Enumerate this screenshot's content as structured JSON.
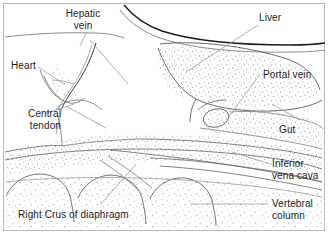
{
  "figure": {
    "background_color": "#ffffff",
    "frame_color": "#b9b9b9",
    "ink_color": "#444444",
    "dark_ink_color": "#1a1a1a",
    "leader_color": "#9a9a9a",
    "label_color": "#1d1d1d",
    "width": 330,
    "height": 236
  },
  "labels": [
    {
      "id": "hepatic-vein",
      "text": "Hepatic",
      "line2": "vein",
      "align": "center",
      "x": 82,
      "y": 8
    },
    {
      "id": "liver",
      "text": "Liver",
      "line2": "",
      "align": "left",
      "x": 259,
      "y": 12
    },
    {
      "id": "heart",
      "text": "Heart",
      "line2": "",
      "align": "left",
      "x": 11,
      "y": 60
    },
    {
      "id": "portal-vein",
      "text": "Portal vein",
      "line2": "",
      "align": "left",
      "x": 263,
      "y": 69
    },
    {
      "id": "central-tendon",
      "text": "Central",
      "line2": "tendon",
      "align": "right",
      "x": 5,
      "y": 108
    },
    {
      "id": "gut",
      "text": "Gut",
      "line2": "",
      "align": "left",
      "x": 279,
      "y": 124
    },
    {
      "id": "inferior-vena-cava",
      "text": "Inferior",
      "line2": "vena cava",
      "align": "left",
      "x": 272,
      "y": 158
    },
    {
      "id": "vertebral-column",
      "text": "Vertebral",
      "line2": "column",
      "align": "left",
      "x": 272,
      "y": 198
    },
    {
      "id": "right-crus-of-diaphragm",
      "text": "Right Crus of diaphragm",
      "line2": "",
      "align": "left",
      "x": 18,
      "y": 209
    }
  ],
  "structures": [
    {
      "id": "diaphragm-dome",
      "name": "diaphragm dome outline"
    },
    {
      "id": "liver-outline",
      "name": "liver outline with stipple"
    },
    {
      "id": "hepatic-vein-vessel",
      "name": "hepatic vein branch"
    },
    {
      "id": "portal-vein-vessel",
      "name": "portal vein lumen"
    },
    {
      "id": "gut-lumen",
      "name": "gut lumen oval"
    },
    {
      "id": "inferior-vena-cava-vessel",
      "name": "inferior vena cava channel"
    },
    {
      "id": "vertebral-bodies",
      "name": "vertebral column arches"
    },
    {
      "id": "central-tendon-region",
      "name": "central tendon of diaphragm"
    },
    {
      "id": "heart-chamber",
      "name": "heart chamber border"
    }
  ]
}
